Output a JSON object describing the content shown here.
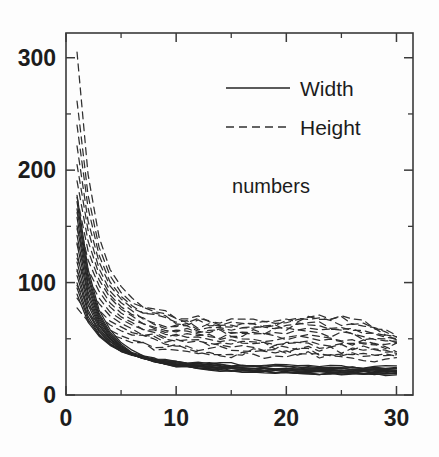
{
  "figure": {
    "background_color": "#fdfdfd",
    "line_color": "#252525"
  },
  "annotation": {
    "numbers_label": "numbers"
  },
  "legend": {
    "entries": [
      {
        "label": "Width",
        "style": "solid"
      },
      {
        "label": "Height",
        "style": "dashed"
      }
    ]
  },
  "axes": {
    "x_major_labels": [
      "0",
      "10",
      "20",
      "30"
    ],
    "y_major_labels": [
      "0",
      "100",
      "200",
      "300"
    ]
  },
  "chart_data": {
    "type": "line",
    "title": "",
    "subtitle": "",
    "xlabel": "",
    "ylabel": "",
    "annotation": "numbers",
    "xlim": [
      0,
      31.5
    ],
    "ylim": [
      0,
      322
    ],
    "x_ticks": [
      0,
      10,
      20,
      30
    ],
    "x_minor_ticks": [
      5,
      15,
      25
    ],
    "y_ticks": [
      0,
      100,
      200,
      300
    ],
    "y_minor_ticks": [
      50,
      150,
      250
    ],
    "grid": false,
    "legend_position": "upper right",
    "legend_entries": [
      "Width",
      "Height"
    ],
    "x": [
      1,
      2,
      3,
      4,
      5,
      6,
      7,
      8,
      9,
      10,
      11,
      12,
      13,
      14,
      15,
      16,
      17,
      18,
      19,
      20,
      21,
      22,
      23,
      24,
      25,
      26,
      27,
      28,
      29,
      30
    ],
    "series": [
      {
        "name": "Width 1",
        "style": "solid",
        "values": [
          178,
          112,
          76,
          58,
          47,
          40,
          35,
          32,
          29,
          27,
          26,
          25,
          24,
          23,
          22,
          22,
          21,
          21,
          20,
          20,
          20,
          20,
          19,
          19,
          19,
          19,
          19,
          19,
          19,
          19
        ]
      },
      {
        "name": "Width 2",
        "style": "solid",
        "values": [
          172,
          108,
          73,
          56,
          45,
          38,
          34,
          31,
          28,
          26,
          25,
          24,
          23,
          22,
          22,
          21,
          21,
          20,
          20,
          20,
          19,
          19,
          19,
          19,
          19,
          19,
          19,
          19,
          18,
          18
        ]
      },
      {
        "name": "Width 3",
        "style": "solid",
        "values": [
          166,
          104,
          71,
          54,
          44,
          37,
          33,
          30,
          28,
          26,
          25,
          24,
          23,
          22,
          22,
          21,
          21,
          20,
          20,
          20,
          20,
          19,
          19,
          19,
          19,
          19,
          19,
          19,
          19,
          19
        ]
      },
      {
        "name": "Width 4",
        "style": "solid",
        "values": [
          158,
          100,
          69,
          53,
          43,
          37,
          33,
          30,
          28,
          26,
          25,
          24,
          23,
          23,
          22,
          22,
          21,
          21,
          21,
          20,
          20,
          20,
          20,
          20,
          20,
          20,
          19,
          19,
          19,
          19
        ]
      },
      {
        "name": "Width 5",
        "style": "solid",
        "values": [
          150,
          96,
          67,
          52,
          43,
          37,
          33,
          30,
          28,
          27,
          26,
          25,
          24,
          23,
          23,
          22,
          22,
          22,
          21,
          21,
          21,
          21,
          20,
          20,
          20,
          20,
          20,
          20,
          20,
          20
        ]
      },
      {
        "name": "Width 6",
        "style": "solid",
        "values": [
          142,
          92,
          65,
          51,
          42,
          36,
          33,
          30,
          28,
          27,
          26,
          25,
          24,
          24,
          23,
          23,
          22,
          22,
          22,
          21,
          21,
          21,
          21,
          21,
          20,
          20,
          20,
          20,
          20,
          20
        ]
      },
      {
        "name": "Width 7",
        "style": "solid",
        "values": [
          134,
          88,
          63,
          50,
          42,
          36,
          33,
          30,
          29,
          27,
          26,
          25,
          25,
          24,
          24,
          23,
          23,
          23,
          22,
          22,
          22,
          22,
          21,
          21,
          21,
          21,
          21,
          21,
          21,
          21
        ]
      },
      {
        "name": "Width 8",
        "style": "solid",
        "values": [
          126,
          84,
          61,
          49,
          41,
          36,
          33,
          30,
          29,
          28,
          27,
          26,
          25,
          25,
          24,
          24,
          23,
          23,
          23,
          23,
          22,
          22,
          22,
          22,
          22,
          22,
          21,
          21,
          21,
          21
        ]
      },
      {
        "name": "Width 9",
        "style": "solid",
        "values": [
          118,
          80,
          59,
          48,
          41,
          36,
          33,
          31,
          29,
          28,
          27,
          26,
          26,
          25,
          25,
          24,
          24,
          24,
          23,
          23,
          23,
          23,
          23,
          22,
          22,
          22,
          22,
          22,
          22,
          22
        ]
      },
      {
        "name": "Width 10",
        "style": "solid",
        "values": [
          112,
          76,
          57,
          47,
          40,
          36,
          33,
          31,
          29,
          28,
          27,
          27,
          26,
          26,
          25,
          25,
          24,
          24,
          24,
          24,
          23,
          23,
          23,
          23,
          23,
          22,
          22,
          22,
          22,
          22
        ]
      },
      {
        "name": "Width 11",
        "style": "solid",
        "values": [
          106,
          73,
          56,
          46,
          40,
          36,
          33,
          31,
          30,
          29,
          28,
          27,
          27,
          26,
          26,
          25,
          25,
          25,
          24,
          24,
          24,
          24,
          24,
          23,
          23,
          23,
          23,
          23,
          23,
          23
        ]
      },
      {
        "name": "Width 12",
        "style": "solid",
        "values": [
          100,
          70,
          54,
          45,
          39,
          35,
          33,
          31,
          30,
          29,
          28,
          28,
          27,
          27,
          26,
          26,
          26,
          25,
          25,
          25,
          25,
          24,
          24,
          24,
          24,
          24,
          24,
          24,
          23,
          23
        ]
      },
      {
        "name": "Width 13",
        "style": "solid",
        "values": [
          95,
          67,
          53,
          45,
          39,
          36,
          33,
          32,
          30,
          29,
          29,
          28,
          28,
          27,
          27,
          27,
          26,
          26,
          26,
          26,
          25,
          25,
          25,
          25,
          25,
          25,
          24,
          24,
          24,
          24
        ]
      },
      {
        "name": "Width 14",
        "style": "solid",
        "values": [
          90,
          65,
          52,
          44,
          39,
          36,
          34,
          32,
          31,
          30,
          29,
          29,
          28,
          28,
          28,
          27,
          27,
          27,
          27,
          26,
          26,
          26,
          26,
          26,
          26,
          25,
          25,
          25,
          25,
          25
        ]
      },
      {
        "name": "Height 1",
        "style": "dashed",
        "values": [
          305,
          196,
          140,
          112,
          96,
          86,
          80,
          76,
          73,
          71,
          70,
          69,
          68,
          67,
          66,
          66,
          66,
          66,
          66,
          67,
          68,
          69,
          70,
          70,
          69,
          67,
          64,
          61,
          58,
          56
        ]
      },
      {
        "name": "Height 2",
        "style": "dashed",
        "values": [
          262,
          178,
          131,
          106,
          91,
          82,
          77,
          73,
          70,
          68,
          67,
          66,
          65,
          64,
          64,
          64,
          64,
          64,
          65,
          66,
          67,
          68,
          68,
          68,
          67,
          65,
          62,
          59,
          56,
          54
        ]
      },
      {
        "name": "Height 3",
        "style": "dashed",
        "values": [
          240,
          166,
          124,
          101,
          88,
          80,
          75,
          71,
          68,
          66,
          65,
          64,
          63,
          63,
          62,
          62,
          63,
          63,
          64,
          64,
          65,
          66,
          66,
          65,
          64,
          62,
          60,
          57,
          55,
          53
        ]
      },
      {
        "name": "Height 4",
        "style": "dashed",
        "values": [
          221,
          155,
          118,
          97,
          85,
          77,
          72,
          69,
          66,
          64,
          63,
          62,
          61,
          61,
          61,
          61,
          61,
          61,
          62,
          62,
          63,
          63,
          63,
          62,
          61,
          59,
          57,
          55,
          53,
          51
        ]
      },
      {
        "name": "Height 5",
        "style": "dashed",
        "values": [
          205,
          146,
          112,
          93,
          82,
          75,
          70,
          67,
          64,
          63,
          61,
          60,
          60,
          59,
          59,
          59,
          59,
          60,
          60,
          60,
          61,
          61,
          60,
          59,
          58,
          57,
          55,
          53,
          51,
          49
        ]
      },
      {
        "name": "Height 6",
        "style": "dashed",
        "values": [
          190,
          137,
          107,
          89,
          79,
          72,
          68,
          65,
          62,
          61,
          59,
          58,
          58,
          57,
          57,
          57,
          57,
          57,
          58,
          58,
          58,
          58,
          57,
          57,
          56,
          55,
          53,
          51,
          49,
          47
        ]
      },
      {
        "name": "Height 7",
        "style": "dashed",
        "values": [
          176,
          129,
          102,
          86,
          76,
          70,
          66,
          62,
          60,
          58,
          57,
          56,
          56,
          55,
          55,
          55,
          55,
          55,
          55,
          55,
          55,
          55,
          55,
          54,
          53,
          52,
          51,
          49,
          47,
          45
        ]
      },
      {
        "name": "Height 8",
        "style": "dashed",
        "values": [
          162,
          120,
          97,
          82,
          73,
          67,
          63,
          60,
          58,
          56,
          55,
          54,
          53,
          53,
          53,
          53,
          53,
          53,
          53,
          52,
          52,
          52,
          52,
          51,
          50,
          49,
          48,
          47,
          45,
          44
        ]
      },
      {
        "name": "Height 9",
        "style": "dashed",
        "values": [
          148,
          112,
          92,
          78,
          70,
          65,
          61,
          58,
          56,
          54,
          53,
          52,
          51,
          51,
          50,
          50,
          50,
          50,
          50,
          50,
          50,
          49,
          49,
          48,
          48,
          47,
          46,
          45,
          44,
          43
        ]
      },
      {
        "name": "Height 10",
        "style": "dashed",
        "values": [
          135,
          104,
          86,
          74,
          67,
          62,
          58,
          55,
          53,
          52,
          50,
          50,
          49,
          48,
          48,
          48,
          48,
          47,
          47,
          47,
          47,
          46,
          46,
          46,
          45,
          45,
          44,
          43,
          42,
          41
        ]
      },
      {
        "name": "Height 11",
        "style": "dashed",
        "values": [
          122,
          96,
          81,
          70,
          64,
          59,
          56,
          53,
          51,
          49,
          48,
          47,
          46,
          46,
          45,
          45,
          45,
          45,
          44,
          44,
          44,
          44,
          43,
          43,
          43,
          42,
          42,
          41,
          40,
          40
        ]
      },
      {
        "name": "Height 12",
        "style": "dashed",
        "values": [
          110,
          88,
          75,
          66,
          60,
          56,
          53,
          50,
          48,
          47,
          46,
          45,
          44,
          43,
          43,
          43,
          42,
          42,
          42,
          42,
          41,
          41,
          41,
          41,
          40,
          40,
          39,
          39,
          38,
          38
        ]
      },
      {
        "name": "Height 13",
        "style": "dashed",
        "values": [
          98,
          80,
          70,
          62,
          57,
          53,
          50,
          47,
          46,
          44,
          43,
          42,
          42,
          41,
          41,
          40,
          40,
          40,
          39,
          39,
          39,
          39,
          38,
          38,
          38,
          37,
          37,
          37,
          36,
          36
        ]
      },
      {
        "name": "Height 14",
        "style": "dashed",
        "values": [
          86,
          72,
          64,
          58,
          53,
          49,
          47,
          45,
          43,
          42,
          41,
          40,
          39,
          39,
          38,
          38,
          38,
          37,
          37,
          37,
          36,
          36,
          36,
          36,
          35,
          35,
          35,
          34,
          34,
          34
        ]
      },
      {
        "name": "Height 15",
        "style": "dashed",
        "values": [
          78,
          66,
          59,
          54,
          50,
          47,
          44,
          42,
          41,
          40,
          39,
          38,
          37,
          37,
          36,
          36,
          35,
          35,
          35,
          34,
          34,
          34,
          34,
          33,
          33,
          33,
          32,
          32,
          32,
          32
        ]
      }
    ]
  }
}
